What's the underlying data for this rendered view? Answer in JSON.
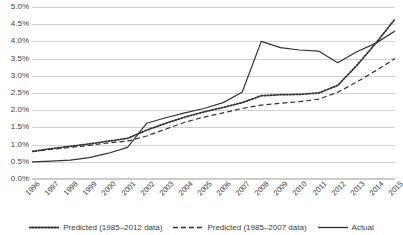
{
  "chart_data": {
    "type": "line",
    "title": "",
    "subtitle": "",
    "xlabel": "",
    "ylabel": "",
    "grid": true,
    "legend_position": "bottom",
    "ylim": [
      0.0,
      5.0
    ],
    "y_ticks": [
      "0.0%",
      "0.5%",
      "1.0%",
      "1.5%",
      "2.0%",
      "2.5%",
      "3.0%",
      "3.5%",
      "4.0%",
      "4.5%",
      "5.0%"
    ],
    "y_tick_values": [
      0.0,
      0.5,
      1.0,
      1.5,
      2.0,
      2.5,
      3.0,
      3.5,
      4.0,
      4.5,
      5.0
    ],
    "categories": [
      "1996",
      "1997",
      "1998",
      "1999",
      "2000",
      "2001",
      "2002",
      "2003",
      "2004",
      "2005",
      "2006",
      "2007",
      "2008",
      "2009",
      "2010",
      "2011",
      "2012",
      "2013",
      "2014",
      "2015"
    ],
    "x": [
      1996,
      1997,
      1998,
      1999,
      2000,
      2001,
      2002,
      2003,
      2004,
      2005,
      2006,
      2007,
      2008,
      2009,
      2010,
      2011,
      2012,
      2013,
      2014,
      2015
    ],
    "series": [
      {
        "name": "Predicted (1985–2012 data)",
        "style": "dotted",
        "color": "#333333",
        "values": [
          0.8,
          0.88,
          0.95,
          1.02,
          1.1,
          1.18,
          1.42,
          1.62,
          1.8,
          1.95,
          2.08,
          2.22,
          2.42,
          2.45,
          2.46,
          2.5,
          2.72,
          3.3,
          3.95,
          4.65
        ]
      },
      {
        "name": "Predicted (1985–2007 data)",
        "style": "dashed",
        "color": "#333333",
        "values": [
          0.8,
          0.86,
          0.92,
          0.98,
          1.05,
          1.1,
          1.25,
          1.45,
          1.65,
          1.8,
          1.92,
          2.05,
          2.15,
          2.2,
          2.25,
          2.32,
          2.52,
          2.82,
          3.15,
          3.5
        ]
      },
      {
        "name": "Actual",
        "style": "solid",
        "color": "#333333",
        "values": [
          0.5,
          0.52,
          0.55,
          0.62,
          0.75,
          0.92,
          1.62,
          1.78,
          1.92,
          2.05,
          2.22,
          2.52,
          4.0,
          3.82,
          3.75,
          3.72,
          3.38,
          3.7,
          3.95,
          4.3
        ]
      }
    ]
  },
  "legend": {
    "items": [
      {
        "label": "Predicted (1985–2012 data)"
      },
      {
        "label": "Predicted (1985–2007 data)"
      },
      {
        "label": "Actual"
      }
    ]
  }
}
